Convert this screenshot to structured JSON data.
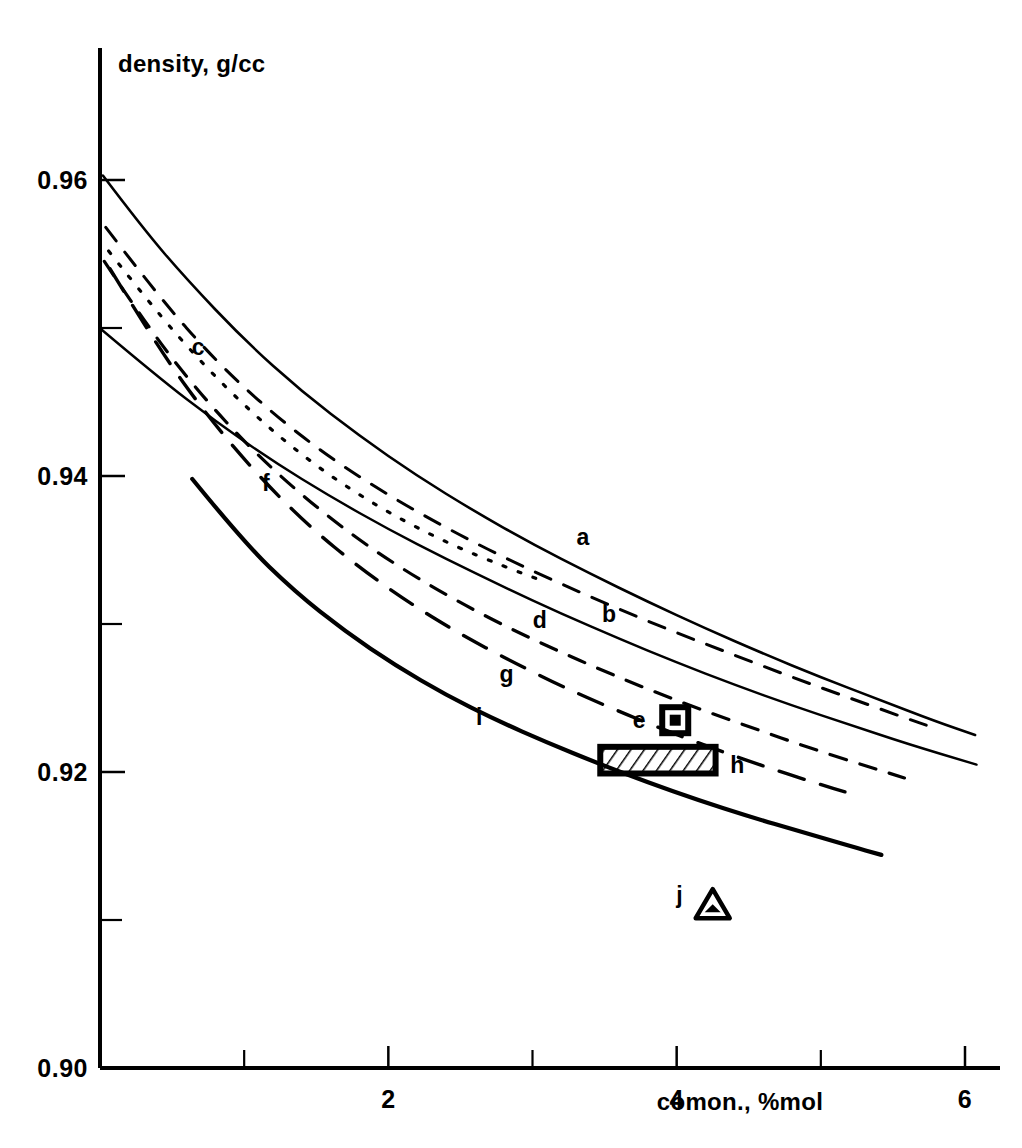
{
  "chart_data": {
    "type": "line",
    "title": "",
    "xlabel": "comon., %mol",
    "ylabel": "density, g/cc",
    "xlim": [
      0,
      6.4
    ],
    "ylim": [
      0.9,
      0.9675
    ],
    "grid": false,
    "legend_position": "inline-labels",
    "x_ticks_major": [
      2,
      4,
      6
    ],
    "x_ticks_major_labels": [
      "2",
      "4",
      "6"
    ],
    "x_ticks_minor": [
      1,
      3,
      5
    ],
    "y_ticks_major": [
      0.9,
      0.92,
      0.94,
      0.96
    ],
    "y_ticks_major_labels": [
      "0.90",
      "0.92",
      "0.94",
      "0.96"
    ],
    "y_ticks_minor": [
      0.91,
      0.93,
      0.95
    ],
    "series": [
      {
        "name": "a",
        "label": "a",
        "style": "solid",
        "width": 2.6,
        "label_x": 3.35,
        "label_y": 0.9359,
        "points": [
          [
            0.02,
            0.9603
          ],
          [
            0.3,
            0.9567
          ],
          [
            0.6,
            0.9533
          ],
          [
            1.0,
            0.9492
          ],
          [
            1.4,
            0.9457
          ],
          [
            1.8,
            0.9427
          ],
          [
            2.2,
            0.94
          ],
          [
            2.6,
            0.9376
          ],
          [
            3.0,
            0.9354
          ],
          [
            3.4,
            0.9334
          ],
          [
            3.8,
            0.9315
          ],
          [
            4.2,
            0.9297
          ],
          [
            4.6,
            0.928
          ],
          [
            5.0,
            0.9264
          ],
          [
            5.4,
            0.9249
          ],
          [
            5.8,
            0.9234
          ],
          [
            6.07,
            0.9225
          ]
        ]
      },
      {
        "name": "b",
        "label": "b",
        "style": "solid",
        "width": 2.4,
        "label_x": 3.53,
        "label_y": 0.9307,
        "points": [
          [
            0.01,
            0.9499
          ],
          [
            0.4,
            0.9467
          ],
          [
            0.8,
            0.9437
          ],
          [
            1.2,
            0.941
          ],
          [
            1.6,
            0.9386
          ],
          [
            2.0,
            0.9364
          ],
          [
            2.4,
            0.9344
          ],
          [
            2.8,
            0.9325
          ],
          [
            3.2,
            0.9307
          ],
          [
            3.6,
            0.929
          ],
          [
            4.0,
            0.9274
          ],
          [
            4.4,
            0.9259
          ],
          [
            4.8,
            0.9245
          ],
          [
            5.2,
            0.9232
          ],
          [
            5.6,
            0.9219
          ],
          [
            6.08,
            0.9205
          ]
        ]
      },
      {
        "name": "c",
        "label": "c",
        "style": "dotted",
        "width": 3.2,
        "label_x": 0.68,
        "label_y": 0.9487,
        "points": [
          [
            0.06,
            0.9552
          ],
          [
            0.35,
            0.9516
          ],
          [
            0.7,
            0.9477
          ],
          [
            1.05,
            0.9443
          ],
          [
            1.4,
            0.9414
          ],
          [
            1.75,
            0.939
          ],
          [
            2.1,
            0.937
          ],
          [
            2.45,
            0.9353
          ],
          [
            2.8,
            0.9339
          ],
          [
            3.1,
            0.9328
          ]
        ]
      },
      {
        "name": "d",
        "label": "d",
        "style": "dashed",
        "width": 3.0,
        "label_x": 3.05,
        "label_y": 0.9303,
        "points": [
          [
            0.04,
            0.9568
          ],
          [
            0.4,
            0.9522
          ],
          [
            0.8,
            0.9478
          ],
          [
            1.2,
            0.9442
          ],
          [
            1.6,
            0.9412
          ],
          [
            2.0,
            0.9387
          ],
          [
            2.4,
            0.9365
          ],
          [
            2.8,
            0.9345
          ],
          [
            3.2,
            0.9327
          ],
          [
            3.6,
            0.931
          ],
          [
            4.0,
            0.9294
          ],
          [
            4.4,
            0.9279
          ],
          [
            4.8,
            0.9264
          ],
          [
            5.2,
            0.925
          ],
          [
            5.6,
            0.9236
          ],
          [
            5.78,
            0.923
          ]
        ]
      },
      {
        "name": "e",
        "label": "e",
        "style": "marker-square",
        "marker_x": 3.99,
        "marker_y": 0.9235,
        "label_x": 3.74,
        "label_y": 0.9235
      },
      {
        "name": "f",
        "label": "f",
        "style": "dashed",
        "width": 3.2,
        "label_x": 1.15,
        "label_y": 0.9395,
        "points": [
          [
            0.03,
            0.9545
          ],
          [
            0.35,
            0.9498
          ],
          [
            0.7,
            0.9455
          ],
          [
            1.05,
            0.9418
          ],
          [
            1.4,
            0.9387
          ],
          [
            1.75,
            0.936
          ],
          [
            2.1,
            0.9337
          ],
          [
            2.45,
            0.9317
          ],
          [
            2.8,
            0.9299
          ],
          [
            3.15,
            0.9283
          ],
          [
            3.5,
            0.9268
          ],
          [
            3.85,
            0.9254
          ],
          [
            4.2,
            0.9241
          ],
          [
            4.55,
            0.9229
          ],
          [
            4.9,
            0.9217
          ],
          [
            5.25,
            0.9206
          ],
          [
            5.58,
            0.9196
          ]
        ]
      },
      {
        "name": "g",
        "label": "g",
        "style": "dashed-long",
        "width": 3.4,
        "label_x": 2.82,
        "label_y": 0.9266,
        "points": [
          [
            0.07,
            0.954
          ],
          [
            0.4,
            0.9487
          ],
          [
            0.75,
            0.944
          ],
          [
            1.1,
            0.94
          ],
          [
            1.45,
            0.9366
          ],
          [
            1.8,
            0.9338
          ],
          [
            2.15,
            0.9314
          ],
          [
            2.5,
            0.9293
          ],
          [
            2.85,
            0.9275
          ],
          [
            3.2,
            0.9258
          ],
          [
            3.55,
            0.9243
          ],
          [
            3.9,
            0.9229
          ],
          [
            4.25,
            0.9216
          ],
          [
            4.6,
            0.9204
          ],
          [
            4.95,
            0.9193
          ],
          [
            5.22,
            0.9185
          ]
        ]
      },
      {
        "name": "h",
        "label": "h",
        "style": "marker-hatched-rect",
        "rect_x0": 3.47,
        "rect_x1": 4.27,
        "rect_y0": 0.9199,
        "rect_y1": 0.9217,
        "label_x": 4.42,
        "label_y": 0.9205
      },
      {
        "name": "i",
        "label": "i",
        "style": "solid-thick",
        "width": 4.2,
        "label_x": 2.63,
        "label_y": 0.9237,
        "points": [
          [
            0.64,
            0.9398
          ],
          [
            1.0,
            0.9355
          ],
          [
            1.35,
            0.9322
          ],
          [
            1.7,
            0.9295
          ],
          [
            2.05,
            0.9272
          ],
          [
            2.4,
            0.9252
          ],
          [
            2.75,
            0.9235
          ],
          [
            3.1,
            0.922
          ],
          [
            3.45,
            0.9206
          ],
          [
            3.8,
            0.9193
          ],
          [
            4.15,
            0.9181
          ],
          [
            4.5,
            0.917
          ],
          [
            4.85,
            0.916
          ],
          [
            5.2,
            0.915
          ],
          [
            5.42,
            0.9144
          ]
        ]
      },
      {
        "name": "j",
        "label": "j",
        "style": "marker-triangle",
        "marker_x": 4.25,
        "marker_y": 0.911,
        "label_x": 4.02,
        "label_y": 0.9117
      }
    ]
  },
  "axes": {
    "y_title": "density, g/cc",
    "x_title": "comon., %mol"
  },
  "colors": {
    "ink": "#000000",
    "background": "#ffffff"
  }
}
